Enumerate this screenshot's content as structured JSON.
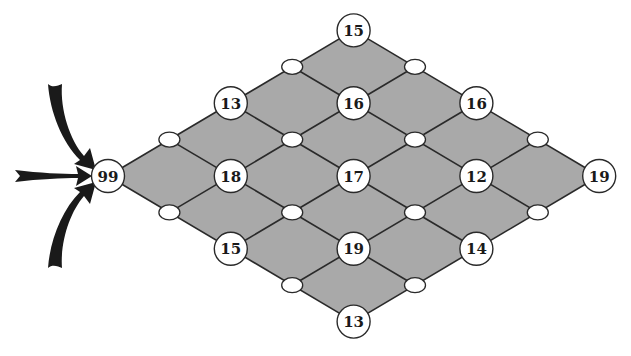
{
  "diagram": {
    "type": "lattice-grid",
    "colors": {
      "fill": "#a9a9a9",
      "line": "#2a2a2a",
      "node_fill": "#ffffff",
      "arrow": "#1a1a1a"
    },
    "geometry": {
      "origin_x": 108,
      "origin_y": 176,
      "step_x": 61.4,
      "step_y": 36.4,
      "grid_size": 4
    },
    "numbered_nodes": [
      {
        "id": "n-0-0",
        "u": 0,
        "v": 0,
        "value": "99"
      },
      {
        "id": "n-2-0",
        "u": 2,
        "v": 0,
        "value": "13"
      },
      {
        "id": "n-4-0",
        "u": 4,
        "v": 0,
        "value": "15"
      },
      {
        "id": "n-1-1",
        "u": 1,
        "v": 1,
        "value": "18"
      },
      {
        "id": "n-3-1",
        "u": 3,
        "v": 1,
        "value": "16"
      },
      {
        "id": "n-0-2",
        "u": 0,
        "v": 2,
        "value": "15"
      },
      {
        "id": "n-2-2",
        "u": 2,
        "v": 2,
        "value": "17"
      },
      {
        "id": "n-4-2",
        "u": 4,
        "v": 2,
        "value": "16"
      },
      {
        "id": "n-1-3",
        "u": 1,
        "v": 3,
        "value": "19"
      },
      {
        "id": "n-3-3",
        "u": 3,
        "v": 3,
        "value": "12"
      },
      {
        "id": "n-0-4",
        "u": 0,
        "v": 4,
        "value": "13"
      },
      {
        "id": "n-2-4",
        "u": 2,
        "v": 4,
        "value": "14"
      },
      {
        "id": "n-4-4",
        "u": 4,
        "v": 4,
        "value": "19"
      }
    ],
    "empty_nodes": [
      {
        "u": 1,
        "v": 0
      },
      {
        "u": 3,
        "v": 0
      },
      {
        "u": 0,
        "v": 1
      },
      {
        "u": 2,
        "v": 1
      },
      {
        "u": 4,
        "v": 1
      },
      {
        "u": 1,
        "v": 2
      },
      {
        "u": 3,
        "v": 2
      },
      {
        "u": 0,
        "v": 3
      },
      {
        "u": 2,
        "v": 3
      },
      {
        "u": 4,
        "v": 3
      },
      {
        "u": 1,
        "v": 4
      },
      {
        "u": 3,
        "v": 4
      }
    ],
    "arrows": [
      {
        "name": "arrow-from-top",
        "direction": "curved-down-right"
      },
      {
        "name": "arrow-from-left",
        "direction": "straight-right"
      },
      {
        "name": "arrow-from-bottom",
        "direction": "curved-up-right"
      }
    ]
  }
}
